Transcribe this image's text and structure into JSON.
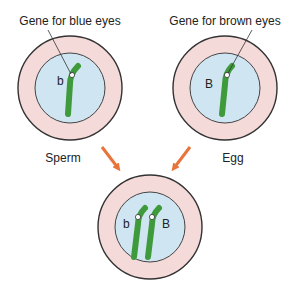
{
  "labels": {
    "blue_gene": "Gene for blue eyes",
    "brown_gene": "Gene for brown eyes",
    "sperm": "Sperm",
    "egg": "Egg",
    "allele_recessive": "b",
    "allele_dominant": "B"
  },
  "colors": {
    "cytoplasm": "#f5dada",
    "nucleus": "#cfe6f2",
    "chromosome": "#3f9a3c",
    "arrow": "#e8743a",
    "outline": "#333333"
  },
  "cells": [
    {
      "name": "sperm",
      "allele": "b"
    },
    {
      "name": "egg",
      "allele": "B"
    },
    {
      "name": "zygote",
      "alleles": [
        "b",
        "B"
      ]
    }
  ]
}
